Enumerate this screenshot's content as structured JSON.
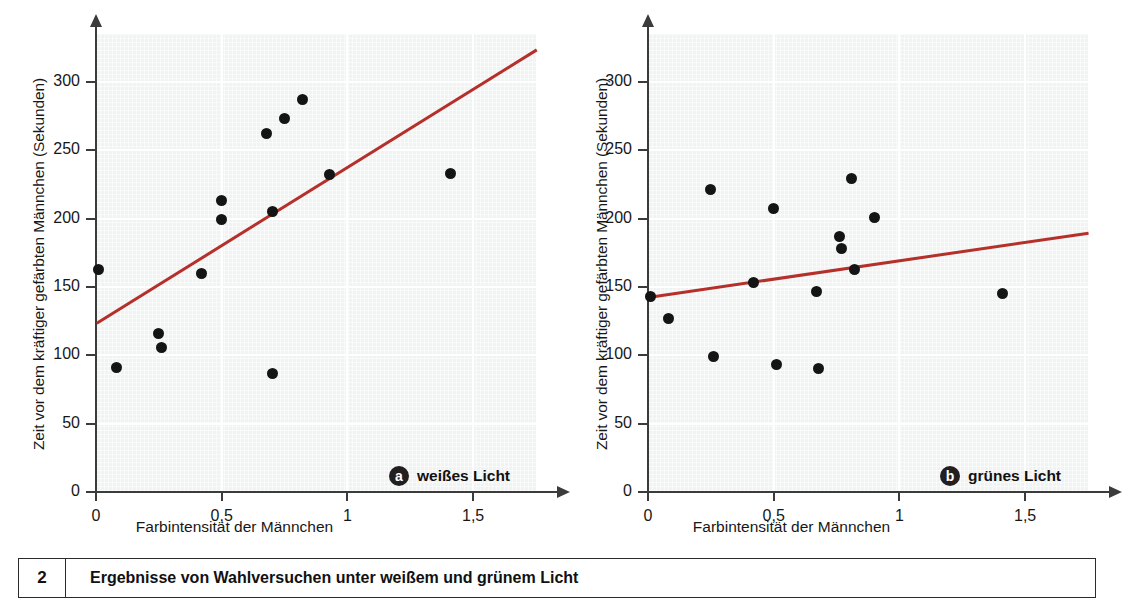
{
  "figure": {
    "number": "2",
    "caption": "Ergebnisse von Wahlversuchen unter weißem und grünem Licht"
  },
  "chart_data": [
    {
      "type": "scatter",
      "id": "panel-a",
      "panel_label": "a",
      "panel_title": "weißes Licht",
      "title": "",
      "xlabel": "Farbintensität der Männchen",
      "ylabel": "Zeit vor dem kräftiger gefärbten Männchen (Sekunden)",
      "xlim": [
        0,
        1.75
      ],
      "ylim": [
        0,
        335
      ],
      "xticks": [
        0,
        0.5,
        1,
        1.5
      ],
      "xticklabels": [
        "0",
        "0,5",
        "1",
        "1,5"
      ],
      "yticks": [
        0,
        50,
        100,
        150,
        200,
        250,
        300
      ],
      "yticklabels": [
        "0",
        "50",
        "100",
        "150",
        "200",
        "250",
        "300"
      ],
      "grid": true,
      "legend": "none",
      "points": [
        {
          "x": 0.01,
          "y": 163
        },
        {
          "x": 0.08,
          "y": 91
        },
        {
          "x": 0.25,
          "y": 116
        },
        {
          "x": 0.26,
          "y": 106
        },
        {
          "x": 0.42,
          "y": 160
        },
        {
          "x": 0.5,
          "y": 213
        },
        {
          "x": 0.5,
          "y": 199
        },
        {
          "x": 0.68,
          "y": 262
        },
        {
          "x": 0.7,
          "y": 205
        },
        {
          "x": 0.7,
          "y": 87
        },
        {
          "x": 0.75,
          "y": 273
        },
        {
          "x": 0.82,
          "y": 287
        },
        {
          "x": 0.93,
          "y": 232
        },
        {
          "x": 1.41,
          "y": 233
        }
      ],
      "trendline": {
        "x1": 0,
        "y1": 124,
        "x2": 1.75,
        "y2": 324,
        "color": "#b5302a"
      }
    },
    {
      "type": "scatter",
      "id": "panel-b",
      "panel_label": "b",
      "panel_title": "grünes Licht",
      "title": "",
      "xlabel": "Farbintensität der Männchen",
      "ylabel": "Zeit vor dem kräftiger gefärbten Männchen (Sekunden)",
      "xlim": [
        0,
        1.75
      ],
      "ylim": [
        0,
        335
      ],
      "xticks": [
        0,
        0.5,
        1,
        1.5
      ],
      "xticklabels": [
        "0",
        "0,5",
        "1",
        "1,5"
      ],
      "yticks": [
        0,
        50,
        100,
        150,
        200,
        250,
        300
      ],
      "yticklabels": [
        "0",
        "50",
        "100",
        "150",
        "200",
        "250",
        "300"
      ],
      "grid": true,
      "legend": "none",
      "points": [
        {
          "x": 0.01,
          "y": 143
        },
        {
          "x": 0.08,
          "y": 127
        },
        {
          "x": 0.25,
          "y": 221
        },
        {
          "x": 0.26,
          "y": 99
        },
        {
          "x": 0.42,
          "y": 153
        },
        {
          "x": 0.5,
          "y": 207
        },
        {
          "x": 0.51,
          "y": 93
        },
        {
          "x": 0.67,
          "y": 147
        },
        {
          "x": 0.68,
          "y": 90
        },
        {
          "x": 0.76,
          "y": 187
        },
        {
          "x": 0.77,
          "y": 178
        },
        {
          "x": 0.81,
          "y": 229
        },
        {
          "x": 0.82,
          "y": 163
        },
        {
          "x": 0.9,
          "y": 201
        },
        {
          "x": 1.41,
          "y": 145
        }
      ],
      "trendline": {
        "x1": 0,
        "y1": 143,
        "x2": 1.75,
        "y2": 190,
        "color": "#b5302a"
      }
    }
  ]
}
